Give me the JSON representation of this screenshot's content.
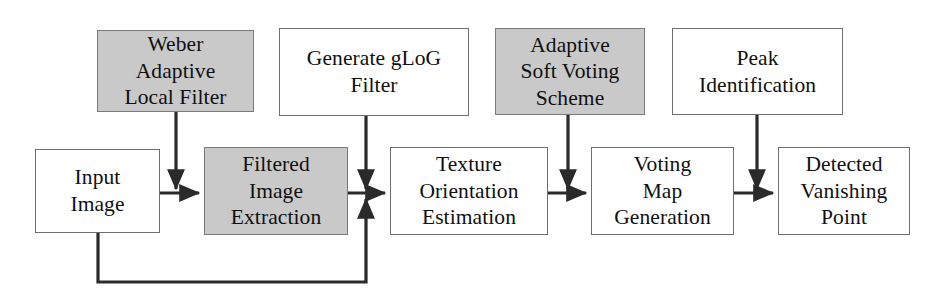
{
  "diagram": {
    "canvas": {
      "width": 947,
      "height": 296,
      "background": "#ffffff"
    },
    "styles": {
      "shaded_fill": "#c9c9c9",
      "plain_fill": "#ffffff",
      "border_color": "#6e6e6e",
      "connector_color": "#2a2a2a",
      "text_color": "#101010"
    },
    "nodes": [
      {
        "id": "weber-adaptive-local-filter",
        "label": "Weber\nAdaptive\nLocal Filter",
        "fill": "shaded",
        "row": "top",
        "x": 97,
        "y": 30,
        "w": 157,
        "h": 82
      },
      {
        "id": "generate-glog-filter",
        "label": "Generate gLoG\nFilter",
        "fill": "plain",
        "row": "top",
        "x": 279,
        "y": 28,
        "w": 190,
        "h": 88
      },
      {
        "id": "adaptive-soft-voting-scheme",
        "label": "Adaptive\nSoft Voting\nScheme",
        "fill": "shaded",
        "row": "top",
        "x": 495,
        "y": 28,
        "w": 150,
        "h": 87
      },
      {
        "id": "peak-identification",
        "label": "Peak\nIdentification",
        "fill": "plain",
        "row": "top",
        "x": 672,
        "y": 28,
        "w": 171,
        "h": 87
      },
      {
        "id": "input-image",
        "label": "Input\nImage",
        "fill": "plain",
        "row": "bottom",
        "x": 35,
        "y": 149,
        "w": 125,
        "h": 84
      },
      {
        "id": "filtered-image-extraction",
        "label": "Filtered\nImage\nExtraction",
        "fill": "shaded",
        "row": "bottom",
        "x": 204,
        "y": 147,
        "w": 144,
        "h": 88
      },
      {
        "id": "texture-orientation-estimation",
        "label": "Texture\nOrientation\nEstimation",
        "fill": "plain",
        "row": "bottom",
        "x": 390,
        "y": 147,
        "w": 158,
        "h": 88
      },
      {
        "id": "voting-map-generation",
        "label": "Voting\nMap\nGeneration",
        "fill": "plain",
        "row": "bottom",
        "x": 591,
        "y": 147,
        "w": 143,
        "h": 88
      },
      {
        "id": "detected-vanishing-point",
        "label": "Detected\nVanishing\nPoint",
        "fill": "plain",
        "row": "bottom",
        "x": 778,
        "y": 147,
        "w": 132,
        "h": 88
      }
    ],
    "connectors": [
      {
        "id": "input-to-filtered",
        "from": "input-image",
        "to": "filtered-image-extraction",
        "kind": "horizontal-arrow"
      },
      {
        "id": "weber-to-filtered",
        "from": "weber-adaptive-local-filter",
        "to": "filtered-image-extraction",
        "kind": "vertical-arrow"
      },
      {
        "id": "filtered-to-texture",
        "from": "filtered-image-extraction",
        "to": "texture-orientation-estimation",
        "kind": "horizontal-arrow"
      },
      {
        "id": "glog-to-texture",
        "from": "generate-glog-filter",
        "to": "texture-orientation-estimation",
        "kind": "vertical-arrow"
      },
      {
        "id": "input-feedback-to-texture",
        "from": "input-image",
        "to": "texture-orientation-estimation",
        "kind": "feedback-loop"
      },
      {
        "id": "texture-to-voting",
        "from": "texture-orientation-estimation",
        "to": "voting-map-generation",
        "kind": "horizontal-arrow"
      },
      {
        "id": "soft-voting-to-voting-map",
        "from": "adaptive-soft-voting-scheme",
        "to": "voting-map-generation",
        "kind": "vertical-arrow"
      },
      {
        "id": "voting-to-detected",
        "from": "voting-map-generation",
        "to": "detected-vanishing-point",
        "kind": "horizontal-arrow"
      },
      {
        "id": "peak-to-detected",
        "from": "peak-identification",
        "to": "detected-vanishing-point",
        "kind": "vertical-arrow"
      }
    ]
  }
}
